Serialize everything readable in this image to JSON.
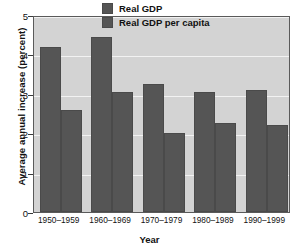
{
  "chart_data": {
    "type": "bar",
    "title": "",
    "xlabel": "Year",
    "ylabel": "Average annual increase (percent)",
    "categories": [
      "1950–1959",
      "1960–1969",
      "1970–1979",
      "1980–1989",
      "1990–1999"
    ],
    "series": [
      {
        "name": "Real GDP",
        "values": [
          4.2,
          4.45,
          3.25,
          3.05,
          3.1
        ],
        "color": "#555555"
      },
      {
        "name": "Real GDP per capita",
        "values": [
          2.6,
          3.05,
          2.0,
          2.25,
          2.2
        ],
        "color": "#555555"
      }
    ],
    "ylim": [
      0,
      5
    ],
    "yticks": [
      0,
      1,
      2,
      3,
      4,
      5
    ],
    "ytick_labels": [
      "0",
      "1",
      "2",
      "3",
      "4",
      "5"
    ],
    "grid": true,
    "legend_position": "top-center",
    "plot_background": "#d3d3d3",
    "gridline_color": "#f2f2f2",
    "frame_color": "#5a5a5a"
  }
}
